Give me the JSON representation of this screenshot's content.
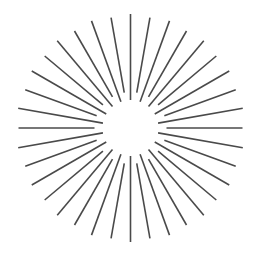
{
  "graphic": {
    "type": "sunburst-radial-lines",
    "center": {
      "x": 130.5,
      "y": 128
    },
    "ray_count": 36,
    "angle_step_deg": 10,
    "start_angle_deg": -90,
    "inner_radii": [
      28,
      36
    ],
    "outer_radii": [
      114,
      112
    ],
    "stroke_color": "#4a4a4a",
    "stroke_width": 1.6,
    "background": "#ffffff"
  }
}
